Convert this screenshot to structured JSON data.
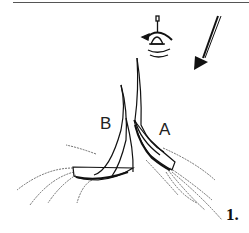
{
  "diagram": {
    "type": "sailing-illustration",
    "labels": {
      "boat_b": "B",
      "boat_a": "A",
      "figure_number": "1."
    },
    "elements": [
      "bell-buoy",
      "wind-arrow",
      "sailboat-b",
      "sailboat-a",
      "wake-lines"
    ],
    "colors": {
      "ink": "#111111",
      "background": "#ffffff"
    }
  }
}
